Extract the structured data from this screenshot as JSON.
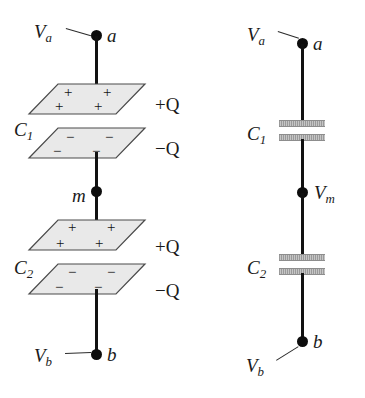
{
  "figure": {
    "colors": {
      "wire": "#111111",
      "plate_fill": "#e9e9e9",
      "plate_stroke": "#4a4a4a",
      "cap_bar": "#a8a8a8",
      "text": "#1a1a1a",
      "background": "#ffffff"
    }
  },
  "physical_view": {
    "top_terminal": {
      "potential_label": "V",
      "potential_sub": "a",
      "node_label": "a"
    },
    "middle_node": {
      "node_label": "m"
    },
    "bottom_terminal": {
      "potential_label": "V",
      "potential_sub": "b",
      "node_label": "b"
    },
    "capacitors": [
      {
        "name": "C",
        "name_sub": "1",
        "top_plate": {
          "charge_label": "+Q",
          "charge_sign": "+",
          "sign_count": 4
        },
        "bottom_plate": {
          "charge_label": "−Q",
          "charge_sign": "−",
          "sign_count": 4
        }
      },
      {
        "name": "C",
        "name_sub": "2",
        "top_plate": {
          "charge_label": "+Q",
          "charge_sign": "+",
          "sign_count": 4
        },
        "bottom_plate": {
          "charge_label": "−Q",
          "charge_sign": "−",
          "sign_count": 4
        }
      }
    ]
  },
  "schematic_view": {
    "top_terminal": {
      "potential_label": "V",
      "potential_sub": "a",
      "node_label": "a"
    },
    "middle_node": {
      "potential_label": "V",
      "potential_sub": "m"
    },
    "bottom_terminal": {
      "potential_label": "V",
      "potential_sub": "b",
      "node_label": "b"
    },
    "capacitors": [
      {
        "name": "C",
        "name_sub": "1"
      },
      {
        "name": "C",
        "name_sub": "2"
      }
    ]
  }
}
